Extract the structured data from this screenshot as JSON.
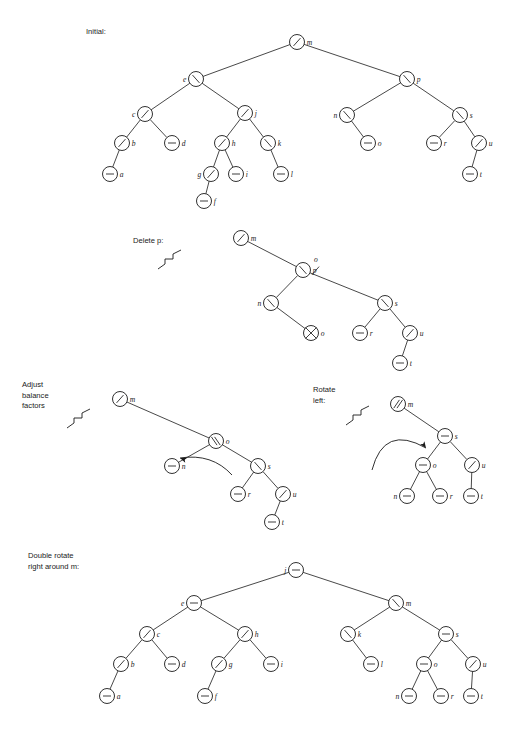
{
  "figure": {
    "background": "#ffffff",
    "ink": "#1a1a1a",
    "node_radius": 7.5,
    "balance_glyphs": {
      "left": "/",
      "right": "\\",
      "balanced": "-",
      "double_left": "//",
      "double_right": "\\\\",
      "deleted": "X"
    }
  },
  "panels": [
    {
      "id": "initial",
      "caption": "Initial:",
      "caption_lines": [
        "Initial:"
      ],
      "caption_x": 86,
      "caption_y": 34,
      "has_break_mark": false,
      "has_arrow": false,
      "nodes": [
        {
          "id": "m",
          "label": "m",
          "bf": "left",
          "x": 297,
          "y": 42,
          "lx": "right"
        },
        {
          "id": "e",
          "label": "e",
          "bf": "right",
          "x": 196,
          "y": 79,
          "lx": "left"
        },
        {
          "id": "p",
          "label": "p",
          "bf": "right",
          "x": 407,
          "y": 79,
          "lx": "right"
        },
        {
          "id": "c",
          "label": "c",
          "bf": "left",
          "x": 145,
          "y": 114,
          "lx": "left"
        },
        {
          "id": "j",
          "label": "j",
          "bf": "left",
          "x": 245,
          "y": 113,
          "lx": "right"
        },
        {
          "id": "n",
          "label": "n",
          "bf": "right",
          "x": 347,
          "y": 115,
          "lx": "left"
        },
        {
          "id": "s",
          "label": "s",
          "bf": "right",
          "x": 460,
          "y": 115,
          "lx": "right"
        },
        {
          "id": "b",
          "label": "b",
          "bf": "left",
          "x": 122,
          "y": 143,
          "lx": "right"
        },
        {
          "id": "d",
          "label": "d",
          "bf": "balanced",
          "x": 172,
          "y": 143,
          "lx": "right"
        },
        {
          "id": "h",
          "label": "h",
          "bf": "left",
          "x": 222,
          "y": 143,
          "lx": "right"
        },
        {
          "id": "k",
          "label": "k",
          "bf": "right",
          "x": 268,
          "y": 143,
          "lx": "right"
        },
        {
          "id": "o",
          "label": "o",
          "bf": "balanced",
          "x": 368,
          "y": 143,
          "lx": "right"
        },
        {
          "id": "r",
          "label": "r",
          "bf": "balanced",
          "x": 434,
          "y": 143,
          "lx": "right"
        },
        {
          "id": "u",
          "label": "u",
          "bf": "left",
          "x": 479,
          "y": 143,
          "lx": "right"
        },
        {
          "id": "a",
          "label": "a",
          "bf": "balanced",
          "x": 110,
          "y": 174,
          "lx": "right"
        },
        {
          "id": "g",
          "label": "g",
          "bf": "left",
          "x": 211,
          "y": 174,
          "lx": "left"
        },
        {
          "id": "i",
          "label": "i",
          "bf": "balanced",
          "x": 236,
          "y": 174,
          "lx": "right"
        },
        {
          "id": "l",
          "label": "l",
          "bf": "balanced",
          "x": 281,
          "y": 174,
          "lx": "right"
        },
        {
          "id": "t",
          "label": "t",
          "bf": "balanced",
          "x": 470,
          "y": 174,
          "lx": "right"
        },
        {
          "id": "f",
          "label": "f",
          "bf": "balanced",
          "x": 204,
          "y": 201,
          "lx": "right"
        }
      ],
      "edges": [
        [
          "m",
          "e"
        ],
        [
          "m",
          "p"
        ],
        [
          "e",
          "c"
        ],
        [
          "e",
          "j"
        ],
        [
          "p",
          "n"
        ],
        [
          "p",
          "s"
        ],
        [
          "c",
          "b"
        ],
        [
          "c",
          "d"
        ],
        [
          "j",
          "h"
        ],
        [
          "j",
          "k"
        ],
        [
          "n",
          "o"
        ],
        [
          "s",
          "r"
        ],
        [
          "s",
          "u"
        ],
        [
          "b",
          "a"
        ],
        [
          "h",
          "g"
        ],
        [
          "h",
          "i"
        ],
        [
          "k",
          "l"
        ],
        [
          "u",
          "t"
        ],
        [
          "g",
          "f"
        ]
      ]
    },
    {
      "id": "delete-p",
      "caption": "Delete p:",
      "caption_lines": [
        "Delete p:"
      ],
      "caption_x": 133,
      "caption_y": 243,
      "has_break_mark": true,
      "break_mark": {
        "x": 172,
        "y": 262
      },
      "has_arrow": false,
      "replacement_note": {
        "old": "p",
        "new": "o",
        "x": 312,
        "y": 247
      },
      "nodes": [
        {
          "id": "m",
          "label": "m",
          "bf": "left",
          "x": 241,
          "y": 238,
          "lx": "right"
        },
        {
          "id": "p",
          "label": "p",
          "bf": "right",
          "x": 303,
          "y": 270,
          "lx": "right",
          "struck": true,
          "relabel": "o"
        },
        {
          "id": "n",
          "label": "n",
          "bf": "right",
          "x": 271,
          "y": 303,
          "lx": "left"
        },
        {
          "id": "s",
          "label": "s",
          "bf": "right",
          "x": 385,
          "y": 303,
          "lx": "right"
        },
        {
          "id": "o",
          "label": "o",
          "bf": "deleted",
          "x": 311,
          "y": 333,
          "lx": "right"
        },
        {
          "id": "r",
          "label": "r",
          "bf": "balanced",
          "x": 360,
          "y": 333,
          "lx": "right"
        },
        {
          "id": "u",
          "label": "u",
          "bf": "left",
          "x": 410,
          "y": 333,
          "lx": "right"
        },
        {
          "id": "t",
          "label": "t",
          "bf": "balanced",
          "x": 400,
          "y": 363,
          "lx": "right"
        }
      ],
      "edges": [
        [
          "m",
          "p"
        ],
        [
          "p",
          "n"
        ],
        [
          "p",
          "s"
        ],
        [
          "n",
          "o"
        ],
        [
          "s",
          "r"
        ],
        [
          "s",
          "u"
        ],
        [
          "u",
          "t"
        ]
      ]
    },
    {
      "id": "adjust-balance",
      "caption": "Adjust balance factors",
      "caption_lines": [
        "Adjust",
        "balance",
        "factors"
      ],
      "caption_x": 22,
      "caption_y": 387,
      "has_break_mark": true,
      "break_mark": {
        "x": 81,
        "y": 421
      },
      "has_arrow": true,
      "arrow": {
        "type": "curve-left",
        "x": 178,
        "y": 462
      },
      "nodes": [
        {
          "id": "m",
          "label": "m",
          "bf": "left",
          "x": 120,
          "y": 399,
          "lx": "right"
        },
        {
          "id": "o",
          "label": "o",
          "bf": "double_right",
          "x": 216,
          "y": 441,
          "lx": "right"
        },
        {
          "id": "n",
          "label": "n",
          "bf": "balanced",
          "x": 172,
          "y": 466,
          "lx": "right"
        },
        {
          "id": "s",
          "label": "s",
          "bf": "right",
          "x": 258,
          "y": 466,
          "lx": "right"
        },
        {
          "id": "r",
          "label": "r",
          "bf": "balanced",
          "x": 238,
          "y": 494,
          "lx": "right"
        },
        {
          "id": "u",
          "label": "u",
          "bf": "left",
          "x": 283,
          "y": 494,
          "lx": "right"
        },
        {
          "id": "t",
          "label": "t",
          "bf": "balanced",
          "x": 272,
          "y": 522,
          "lx": "right"
        }
      ],
      "edges": [
        [
          "m",
          "o"
        ],
        [
          "o",
          "n"
        ],
        [
          "o",
          "s"
        ],
        [
          "s",
          "r"
        ],
        [
          "s",
          "u"
        ],
        [
          "u",
          "t"
        ]
      ]
    },
    {
      "id": "rotate-left",
      "caption": "Rotate left:",
      "caption_lines": [
        "Rotate",
        "left:"
      ],
      "caption_x": 313,
      "caption_y": 392,
      "has_break_mark": true,
      "break_mark": {
        "x": 360,
        "y": 418
      },
      "has_arrow": true,
      "arrow": {
        "type": "curve-right",
        "x": 378,
        "y": 430
      },
      "nodes": [
        {
          "id": "m",
          "label": "m",
          "bf": "double_left",
          "x": 398,
          "y": 404,
          "lx": "right"
        },
        {
          "id": "s",
          "label": "s",
          "bf": "balanced",
          "x": 445,
          "y": 436,
          "lx": "right"
        },
        {
          "id": "o",
          "label": "o",
          "bf": "balanced",
          "x": 423,
          "y": 465,
          "lx": "right"
        },
        {
          "id": "u",
          "label": "u",
          "bf": "left",
          "x": 472,
          "y": 465,
          "lx": "right"
        },
        {
          "id": "n",
          "label": "n",
          "bf": "balanced",
          "x": 407,
          "y": 496,
          "lx": "left"
        },
        {
          "id": "r",
          "label": "r",
          "bf": "balanced",
          "x": 440,
          "y": 496,
          "lx": "right"
        },
        {
          "id": "t",
          "label": "t",
          "bf": "balanced",
          "x": 471,
          "y": 496,
          "lx": "right"
        }
      ],
      "edges": [
        [
          "m",
          "s"
        ],
        [
          "s",
          "o"
        ],
        [
          "s",
          "u"
        ],
        [
          "o",
          "n"
        ],
        [
          "o",
          "r"
        ],
        [
          "u",
          "t"
        ]
      ]
    },
    {
      "id": "double-rotate-right",
      "caption": "Double rotate right around m:",
      "caption_lines": [
        "Double rotate",
        "right around m:"
      ],
      "caption_x": 28,
      "caption_y": 558,
      "has_break_mark": false,
      "has_arrow": false,
      "nodes": [
        {
          "id": "j",
          "label": "j",
          "bf": "balanced",
          "x": 296,
          "y": 570,
          "lx": "left"
        },
        {
          "id": "e",
          "label": "e",
          "bf": "balanced",
          "x": 194,
          "y": 603,
          "lx": "left"
        },
        {
          "id": "m",
          "label": "m",
          "bf": "right",
          "x": 396,
          "y": 603,
          "lx": "right"
        },
        {
          "id": "c",
          "label": "c",
          "bf": "left",
          "x": 147,
          "y": 634,
          "lx": "right"
        },
        {
          "id": "h",
          "label": "h",
          "bf": "left",
          "x": 245,
          "y": 634,
          "lx": "right"
        },
        {
          "id": "k",
          "label": "k",
          "bf": "right",
          "x": 348,
          "y": 634,
          "lx": "right"
        },
        {
          "id": "s",
          "label": "s",
          "bf": "balanced",
          "x": 446,
          "y": 634,
          "lx": "right"
        },
        {
          "id": "b",
          "label": "b",
          "bf": "left",
          "x": 121,
          "y": 664,
          "lx": "right"
        },
        {
          "id": "d",
          "label": "d",
          "bf": "balanced",
          "x": 172,
          "y": 664,
          "lx": "right"
        },
        {
          "id": "g",
          "label": "g",
          "bf": "left",
          "x": 219,
          "y": 664,
          "lx": "right"
        },
        {
          "id": "i",
          "label": "i",
          "bf": "balanced",
          "x": 271,
          "y": 664,
          "lx": "right"
        },
        {
          "id": "l",
          "label": "l",
          "bf": "balanced",
          "x": 371,
          "y": 664,
          "lx": "right"
        },
        {
          "id": "o",
          "label": "o",
          "bf": "balanced",
          "x": 424,
          "y": 664,
          "lx": "right"
        },
        {
          "id": "u",
          "label": "u",
          "bf": "left",
          "x": 473,
          "y": 664,
          "lx": "right"
        },
        {
          "id": "a",
          "label": "a",
          "bf": "balanced",
          "x": 107,
          "y": 696,
          "lx": "right"
        },
        {
          "id": "f",
          "label": "f",
          "bf": "balanced",
          "x": 205,
          "y": 696,
          "lx": "right"
        },
        {
          "id": "n",
          "label": "n",
          "bf": "balanced",
          "x": 409,
          "y": 696,
          "lx": "left"
        },
        {
          "id": "r",
          "label": "r",
          "bf": "balanced",
          "x": 441,
          "y": 696,
          "lx": "right"
        },
        {
          "id": "t",
          "label": "t",
          "bf": "balanced",
          "x": 471,
          "y": 696,
          "lx": "right"
        }
      ],
      "edges": [
        [
          "j",
          "e"
        ],
        [
          "j",
          "m"
        ],
        [
          "e",
          "c"
        ],
        [
          "e",
          "h"
        ],
        [
          "m",
          "k"
        ],
        [
          "m",
          "s"
        ],
        [
          "c",
          "b"
        ],
        [
          "c",
          "d"
        ],
        [
          "h",
          "g"
        ],
        [
          "h",
          "i"
        ],
        [
          "k",
          "l"
        ],
        [
          "s",
          "o"
        ],
        [
          "s",
          "u"
        ],
        [
          "b",
          "a"
        ],
        [
          "g",
          "f"
        ],
        [
          "o",
          "n"
        ],
        [
          "o",
          "r"
        ],
        [
          "u",
          "t"
        ]
      ]
    }
  ]
}
